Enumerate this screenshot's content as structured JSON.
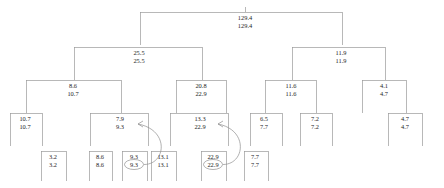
{
  "diagram": {
    "line_color": "#9a9a9a",
    "text_color": "#1c1c1c",
    "nodes": [
      {
        "id": "root",
        "x": 245,
        "y": 12,
        "top": "129.4",
        "bottom": "129.4",
        "left": 140,
        "right": 342,
        "stub": true
      },
      {
        "id": "n-25",
        "x": 139,
        "y": 47,
        "top": "25.5",
        "bottom": "25.5",
        "left": 74,
        "right": 202
      },
      {
        "id": "n-119",
        "x": 341,
        "y": 47,
        "top": "11.9",
        "bottom": "11.9",
        "left": 292,
        "right": 385
      },
      {
        "id": "n-86",
        "x": 73,
        "y": 80,
        "top": "8.6",
        "bottom": "10.7",
        "left": 26,
        "right": 121
      },
      {
        "id": "n-208",
        "x": 201,
        "y": 80,
        "top": "20.8",
        "bottom": "22.9",
        "left": 176,
        "right": 226
      },
      {
        "id": "n-116",
        "x": 291,
        "y": 80,
        "top": "11.6",
        "bottom": "11.6",
        "left": 265,
        "right": 316
      },
      {
        "id": "n-41",
        "x": 384,
        "y": 80,
        "top": "4.1",
        "bottom": "4.7",
        "left": 362,
        "right": 406
      },
      {
        "id": "n-107",
        "x": 25,
        "y": 113,
        "top": "10.7",
        "bottom": "10.7",
        "left": 10,
        "right": 42
      },
      {
        "id": "n-79",
        "x": 120,
        "y": 113,
        "top": "7.9",
        "bottom": "9.3",
        "left": 90,
        "right": 148,
        "arrow_target": true
      },
      {
        "id": "n-133",
        "x": 200,
        "y": 113,
        "top": "13.3",
        "bottom": "22.9",
        "left": 170,
        "right": 228,
        "arrow_target": true
      },
      {
        "id": "n-65",
        "x": 264,
        "y": 113,
        "top": "6.5",
        "bottom": "7.7",
        "left": 250,
        "right": 282
      },
      {
        "id": "n-72",
        "x": 315,
        "y": 113,
        "top": "7.2",
        "bottom": "7.2",
        "left": 300,
        "right": 332
      },
      {
        "id": "n-47",
        "x": 405,
        "y": 113,
        "top": "4.7",
        "bottom": "4.7",
        "left": 388,
        "right": 422
      }
    ],
    "leaves": [
      {
        "id": "l-32",
        "x": 53,
        "y": 151,
        "top": "3.2",
        "bottom": "3.2",
        "left": 41,
        "right": 66,
        "circled": false
      },
      {
        "id": "l-86",
        "x": 100,
        "y": 151,
        "top": "8.6",
        "bottom": "8.6",
        "left": 89,
        "right": 112,
        "circled": false
      },
      {
        "id": "l-93",
        "x": 134,
        "y": 151,
        "top": "9.3",
        "bottom": "9.3",
        "left": 122,
        "right": 147,
        "circled": true
      },
      {
        "id": "l-131",
        "x": 163,
        "y": 151,
        "top": "13.1",
        "bottom": "13.1",
        "left": 151,
        "right": 176,
        "circled": false
      },
      {
        "id": "l-229",
        "x": 213,
        "y": 151,
        "top": "22.9",
        "bottom": "22.9",
        "left": 201,
        "right": 226,
        "circled": true
      },
      {
        "id": "l-77",
        "x": 255,
        "y": 151,
        "top": "7.7",
        "bottom": "7.7",
        "left": 244,
        "right": 268,
        "circled": false
      }
    ],
    "annotations": [
      {
        "id": "arrow-93",
        "label": "curved-arrow-to-9.3",
        "from_leaf": "l-93",
        "to_node": "n-79"
      },
      {
        "id": "arrow-229",
        "label": "curved-arrow-to-22.9",
        "from_leaf": "l-229",
        "to_node": "n-133"
      }
    ]
  }
}
